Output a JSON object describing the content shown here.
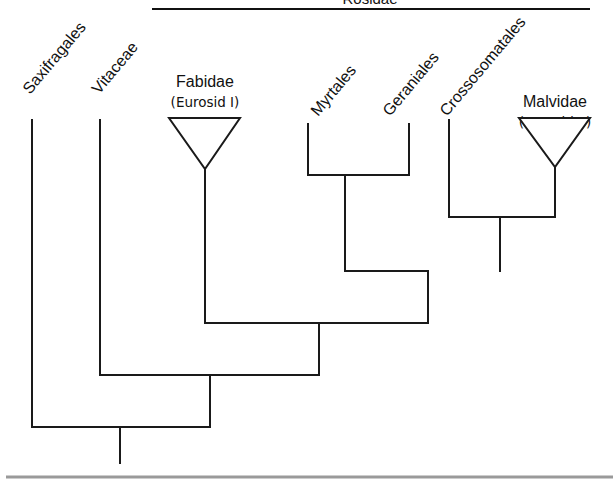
{
  "diagram": {
    "type": "cladogram",
    "top_bracket": {
      "label": "Rosidae",
      "label_partially_visible": true
    },
    "taxa": [
      {
        "id": "saxifragales",
        "label": "Saxifragales",
        "kind": "tip"
      },
      {
        "id": "vitaceae",
        "label": "Vitaceae",
        "kind": "tip"
      },
      {
        "id": "fabidae",
        "label": "Fabidae",
        "sublabel": "(Eurosid I)",
        "kind": "collapsed-clade"
      },
      {
        "id": "myrtales",
        "label": "Myrtales",
        "kind": "tip"
      },
      {
        "id": "geraniales",
        "label": "Geraniales",
        "kind": "tip"
      },
      {
        "id": "crossosomatales",
        "label": "Crossosomatales",
        "kind": "tip"
      },
      {
        "id": "malvidae",
        "label": "Malvidae",
        "sublabel": "(Eurosid II)",
        "kind": "collapsed-clade"
      }
    ],
    "topology": "(Saxifragales,(Vitaceae,(Fabidae,((Myrtales,Geraniales),(Crossosomatales,Malvidae)))))",
    "colors": {
      "line": "#1a1a1a",
      "background": "#ffffff",
      "bottom_rule": "#9a9a9a"
    }
  }
}
